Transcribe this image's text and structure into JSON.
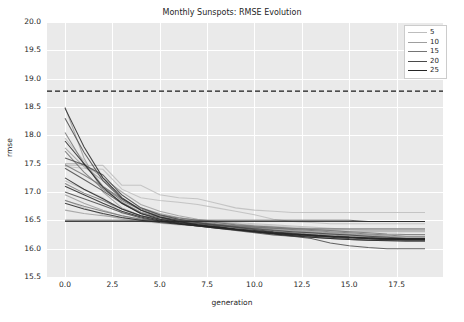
{
  "chart_data": {
    "type": "line",
    "title": "Monthly Sunspots: RMSE Evolution",
    "xlabel": "generation",
    "ylabel": "rmse",
    "xlim": [
      -0.95,
      19.95
    ],
    "ylim": [
      15.5,
      20.0
    ],
    "xticks": [
      "0.0",
      "2.5",
      "5.0",
      "7.5",
      "10.0",
      "12.5",
      "15.0",
      "17.5"
    ],
    "xtick_values": [
      0.0,
      2.5,
      5.0,
      7.5,
      10.0,
      12.5,
      15.0,
      17.5
    ],
    "yticks": [
      "15.5",
      "16.0",
      "16.5",
      "17.0",
      "17.5",
      "18.0",
      "18.5",
      "19.0",
      "19.5",
      "20.0"
    ],
    "ytick_values": [
      15.5,
      16.0,
      16.5,
      17.0,
      17.5,
      18.0,
      18.5,
      19.0,
      19.5,
      20.0
    ],
    "grid": true,
    "legend_position": "upper right",
    "legend_title": "",
    "baseline": {
      "value": 18.78,
      "style": "dashed",
      "color": "#1a1a1a",
      "label": "baseline"
    },
    "x": [
      0,
      1,
      2,
      3,
      4,
      5,
      6,
      7,
      8,
      9,
      10,
      11,
      12,
      13,
      14,
      15,
      16,
      17,
      18,
      19
    ],
    "legend_entries": [
      {
        "label": "5",
        "color": "#bdbdbd",
        "width": 0.9
      },
      {
        "label": "10",
        "color": "#9e9e9e",
        "width": 1.0
      },
      {
        "label": "15",
        "color": "#757575",
        "width": 1.1
      },
      {
        "label": "20",
        "color": "#4a4a4a",
        "width": 1.3
      },
      {
        "label": "25",
        "color": "#262626",
        "width": 1.4
      }
    ],
    "series": [
      {
        "name": "5",
        "color": "#bdbdbd",
        "values": [
          17.47,
          17.47,
          17.47,
          17.12,
          17.12,
          16.95,
          16.9,
          16.88,
          16.8,
          16.72,
          16.68,
          16.66,
          16.64,
          16.64,
          16.64,
          16.64,
          16.64,
          16.64,
          16.64,
          16.64
        ]
      },
      {
        "name": "5",
        "color": "#bdbdbd",
        "values": [
          17.2,
          17.05,
          16.9,
          16.62,
          16.58,
          16.52,
          16.48,
          16.48,
          16.46,
          16.44,
          16.42,
          16.4,
          16.38,
          16.36,
          16.34,
          16.34,
          16.33,
          16.33,
          16.33,
          16.33
        ]
      },
      {
        "name": "5",
        "color": "#bdbdbd",
        "values": [
          16.86,
          16.72,
          16.6,
          16.52,
          16.48,
          16.45,
          16.42,
          16.4,
          16.38,
          16.36,
          16.34,
          16.32,
          16.3,
          16.28,
          16.26,
          16.24,
          16.22,
          16.2,
          16.18,
          16.18
        ]
      },
      {
        "name": "5",
        "color": "#bdbdbd",
        "values": [
          17.95,
          17.55,
          17.1,
          16.8,
          16.65,
          16.58,
          16.54,
          16.5,
          16.48,
          16.46,
          16.44,
          16.42,
          16.4,
          16.38,
          16.36,
          16.34,
          16.33,
          16.33,
          16.33,
          16.33
        ]
      },
      {
        "name": "5",
        "color": "#bdbdbd",
        "values": [
          17.45,
          17.42,
          17.4,
          17.05,
          16.9,
          16.85,
          16.82,
          16.78,
          16.72,
          16.66,
          16.6,
          16.52,
          16.48,
          16.46,
          16.44,
          16.44,
          16.44,
          16.44,
          16.44,
          16.44
        ]
      },
      {
        "name": "10",
        "color": "#9e9e9e",
        "values": [
          18.5,
          17.6,
          17.0,
          16.72,
          16.58,
          16.52,
          16.48,
          16.44,
          16.4,
          16.36,
          16.32,
          16.28,
          16.26,
          16.24,
          16.22,
          16.2,
          16.18,
          16.18,
          16.18,
          16.18
        ]
      },
      {
        "name": "10",
        "color": "#9e9e9e",
        "values": [
          17.78,
          17.45,
          17.2,
          16.95,
          16.72,
          16.62,
          16.55,
          16.5,
          16.46,
          16.42,
          16.38,
          16.34,
          16.32,
          16.3,
          16.28,
          16.26,
          16.24,
          16.22,
          16.2,
          16.2
        ]
      },
      {
        "name": "10",
        "color": "#9e9e9e",
        "values": [
          16.95,
          16.8,
          16.68,
          16.58,
          16.52,
          16.48,
          16.45,
          16.42,
          16.4,
          16.38,
          16.36,
          16.34,
          16.32,
          16.3,
          16.28,
          16.26,
          16.24,
          16.22,
          16.2,
          16.2
        ]
      },
      {
        "name": "10",
        "color": "#9e9e9e",
        "values": [
          17.5,
          17.5,
          17.25,
          17.0,
          16.78,
          16.66,
          16.58,
          16.52,
          16.48,
          16.44,
          16.4,
          16.38,
          16.36,
          16.34,
          16.32,
          16.3,
          16.3,
          16.3,
          16.3,
          16.3
        ]
      },
      {
        "name": "10",
        "color": "#9e9e9e",
        "values": [
          16.68,
          16.62,
          16.58,
          16.54,
          16.5,
          16.48,
          16.46,
          16.44,
          16.42,
          16.4,
          16.38,
          16.36,
          16.34,
          16.33,
          16.33,
          16.33,
          16.33,
          16.33,
          16.33,
          16.33
        ]
      },
      {
        "name": "15",
        "color": "#757575",
        "values": [
          17.72,
          17.35,
          17.05,
          16.82,
          16.64,
          16.56,
          16.5,
          16.46,
          16.42,
          16.38,
          16.34,
          16.3,
          16.28,
          16.26,
          16.24,
          16.22,
          16.2,
          16.18,
          16.17,
          16.17
        ]
      },
      {
        "name": "15",
        "color": "#757575",
        "values": [
          17.15,
          16.98,
          16.85,
          16.7,
          16.58,
          16.52,
          16.48,
          16.45,
          16.42,
          16.4,
          16.38,
          16.36,
          16.34,
          16.32,
          16.3,
          16.28,
          16.26,
          16.24,
          16.22,
          16.22
        ]
      },
      {
        "name": "15",
        "color": "#757575",
        "values": [
          18.05,
          17.5,
          17.1,
          16.85,
          16.68,
          16.58,
          16.52,
          16.48,
          16.44,
          16.4,
          16.36,
          16.33,
          16.3,
          16.28,
          16.26,
          16.24,
          16.22,
          16.2,
          16.18,
          16.18
        ]
      },
      {
        "name": "15",
        "color": "#757575",
        "values": [
          16.85,
          16.75,
          16.66,
          16.58,
          16.52,
          16.48,
          16.46,
          16.44,
          16.42,
          16.4,
          16.38,
          16.36,
          16.35,
          16.35,
          16.35,
          16.35,
          16.35,
          16.35,
          16.35,
          16.35
        ]
      },
      {
        "name": "15",
        "color": "#757575",
        "values": [
          17.48,
          17.3,
          17.1,
          16.88,
          16.7,
          16.6,
          16.54,
          16.5,
          16.46,
          16.42,
          16.4,
          16.38,
          16.36,
          16.34,
          16.32,
          16.3,
          16.28,
          16.26,
          16.25,
          16.25
        ]
      },
      {
        "name": "20",
        "color": "#4a4a4a",
        "values": [
          18.3,
          17.7,
          17.2,
          16.88,
          16.68,
          16.56,
          16.5,
          16.46,
          16.42,
          16.38,
          16.34,
          16.3,
          16.27,
          16.24,
          16.22,
          16.2,
          16.18,
          16.17,
          16.16,
          16.16
        ]
      },
      {
        "name": "20",
        "color": "#4a4a4a",
        "values": [
          17.42,
          17.22,
          17.02,
          16.8,
          16.62,
          16.54,
          16.48,
          16.44,
          16.41,
          16.38,
          16.35,
          16.32,
          16.3,
          16.28,
          16.26,
          16.24,
          16.22,
          16.2,
          16.18,
          16.18
        ]
      },
      {
        "name": "20",
        "color": "#4a4a4a",
        "values": [
          16.5,
          16.5,
          16.5,
          16.5,
          16.5,
          16.5,
          16.5,
          16.5,
          16.5,
          16.5,
          16.5,
          16.5,
          16.5,
          16.5,
          16.5,
          16.5,
          16.48,
          16.48,
          16.48,
          16.48
        ]
      },
      {
        "name": "20",
        "color": "#4a4a4a",
        "values": [
          17.0,
          16.88,
          16.76,
          16.64,
          16.54,
          16.48,
          16.44,
          16.4,
          16.36,
          16.32,
          16.28,
          16.24,
          16.22,
          16.2,
          16.18,
          16.16,
          16.15,
          16.15,
          16.15,
          16.15
        ]
      },
      {
        "name": "20",
        "color": "#4a4a4a",
        "values": [
          17.6,
          17.48,
          17.3,
          16.95,
          16.72,
          16.6,
          16.52,
          16.46,
          16.4,
          16.34,
          16.3,
          16.26,
          16.22,
          16.18,
          16.1,
          16.05,
          16.02,
          16.0,
          16.0,
          16.0
        ]
      },
      {
        "name": "25",
        "color": "#262626",
        "values": [
          18.48,
          17.8,
          17.25,
          16.9,
          16.68,
          16.56,
          16.48,
          16.42,
          16.38,
          16.34,
          16.3,
          16.26,
          16.23,
          16.2,
          16.18,
          16.16,
          16.15,
          16.14,
          16.13,
          16.13
        ]
      },
      {
        "name": "25",
        "color": "#262626",
        "values": [
          17.9,
          17.5,
          17.08,
          16.8,
          16.62,
          16.52,
          16.46,
          16.42,
          16.38,
          16.34,
          16.3,
          16.27,
          16.24,
          16.22,
          16.2,
          16.18,
          16.17,
          16.16,
          16.16,
          16.16
        ]
      },
      {
        "name": "25",
        "color": "#262626",
        "values": [
          17.25,
          17.05,
          16.88,
          16.7,
          16.58,
          16.5,
          16.45,
          16.41,
          16.38,
          16.35,
          16.32,
          16.29,
          16.26,
          16.24,
          16.22,
          16.2,
          16.19,
          16.18,
          16.18,
          16.18
        ]
      },
      {
        "name": "25",
        "color": "#262626",
        "values": [
          16.8,
          16.7,
          16.62,
          16.55,
          16.5,
          16.46,
          16.43,
          16.4,
          16.37,
          16.34,
          16.31,
          16.28,
          16.26,
          16.24,
          16.22,
          16.2,
          16.19,
          16.18,
          16.18,
          16.18
        ]
      },
      {
        "name": "25",
        "color": "#262626",
        "values": [
          16.48,
          16.48,
          16.48,
          16.48,
          16.48,
          16.48,
          16.48,
          16.48,
          16.48,
          16.48,
          16.48,
          16.48,
          16.48,
          16.48,
          16.48,
          16.48,
          16.48,
          16.48,
          16.48,
          16.48
        ]
      },
      {
        "name": "25",
        "color": "#262626",
        "values": [
          17.1,
          16.95,
          16.8,
          16.66,
          16.56,
          16.49,
          16.44,
          16.4,
          16.36,
          16.33,
          16.3,
          16.27,
          16.25,
          16.23,
          16.21,
          16.2,
          16.18,
          16.17,
          16.16,
          16.16
        ]
      }
    ]
  }
}
